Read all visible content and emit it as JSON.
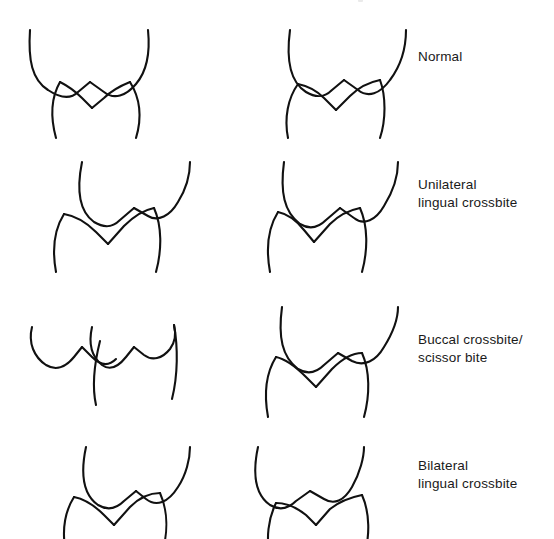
{
  "figure": {
    "kind": "dental-occlusion-diagram",
    "background_color": "#ffffff",
    "line_color": "#111111",
    "text_color": "#1a1a1a",
    "top_clip_text": "",
    "rows": [
      {
        "id": "normal",
        "label_lines": [
          "Normal"
        ],
        "left_diagram_name": "normal-left-side-occlusion",
        "right_diagram_name": "normal-right-side-occlusion"
      },
      {
        "id": "unilateral-lingual-crossbite",
        "label_lines": [
          "Unilateral",
          "lingual crossbite"
        ],
        "left_diagram_name": "unilateral-lingual-crossbite-left-side",
        "right_diagram_name": "unilateral-lingual-crossbite-right-side"
      },
      {
        "id": "buccal-crossbite-scissor-bite",
        "label_lines": [
          "Buccal crossbite/",
          "scissor bite"
        ],
        "left_diagram_name": "buccal-crossbite-left-side",
        "right_diagram_name": "buccal-crossbite-right-side"
      },
      {
        "id": "bilateral-lingual-crossbite",
        "label_lines": [
          "Bilateral",
          "lingual crossbite"
        ],
        "left_diagram_name": "bilateral-lingual-crossbite-left-side",
        "right_diagram_name": "bilateral-lingual-crossbite-right-side"
      }
    ]
  }
}
